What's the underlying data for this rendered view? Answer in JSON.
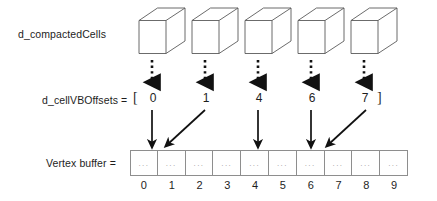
{
  "diagram": {
    "labels": {
      "compacted_cells": "d_compactedCells",
      "cell_vbo_offsets": "d_cellVBOffsets  =",
      "vertex_buffer": "Vertex buffer  =",
      "bracket_open": "[",
      "bracket_close": "]"
    },
    "cells": {
      "count": 5,
      "icon": "wireframe-cube-icon"
    },
    "offsets": {
      "values": [
        "0",
        "1",
        "4",
        "6",
        "7"
      ],
      "target_index": [
        0,
        1,
        4,
        6,
        7
      ]
    },
    "vertex_buffer": {
      "cell_text": "...",
      "indices": [
        "0",
        "1",
        "2",
        "3",
        "4",
        "5",
        "6",
        "7",
        "8",
        "9"
      ]
    },
    "arrows": {
      "dotted_label": "dotted-down-arrow",
      "solid_straight_label": "solid-down-arrow",
      "solid_diagonal_label": "solid-diagonal-arrow"
    },
    "colors": {
      "stroke": "#1d1d1d",
      "cube_stroke": "#5a5a5a",
      "table_border": "#8e8e8e",
      "ellipsis": "#9a9a9a",
      "background": "#ffffff"
    }
  }
}
